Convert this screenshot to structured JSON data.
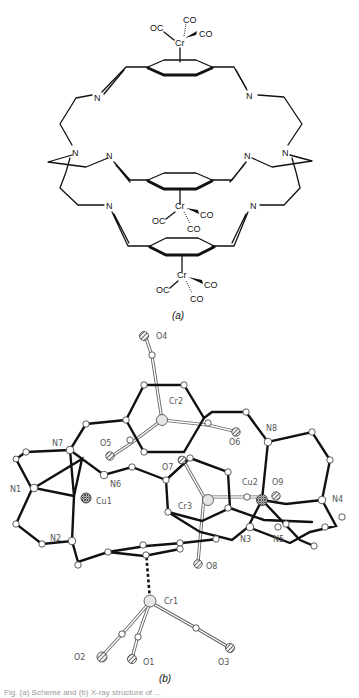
{
  "figure": {
    "panel_a": {
      "caption": "(a)",
      "cr_labels": [
        "Cr",
        "Cr",
        "Cr"
      ],
      "co_labels": [
        "OC",
        "CO",
        "CO",
        "OC",
        "CO",
        "CO",
        "OC",
        "CO",
        "CO"
      ],
      "n_labels": [
        "N",
        "N",
        "N",
        "N",
        "N",
        "N",
        "N",
        "N"
      ]
    },
    "panel_b": {
      "caption": "(b)",
      "atom_labels": {
        "O4": "O4",
        "Cr2": "Cr2",
        "O5": "O5",
        "O6": "O6",
        "N8": "N8",
        "N7": "N7",
        "O7": "O7",
        "N1": "N1",
        "N6": "N6",
        "Cu1": "Cu1",
        "Cu2": "Cu2",
        "O9": "O9",
        "N4": "N4",
        "Cr3": "Cr3",
        "N3": "N3",
        "N5": "N5",
        "N2": "N2",
        "O8": "O8",
        "Cr1": "Cr1",
        "O2": "O2",
        "O1": "O1",
        "O3": "O3"
      }
    },
    "footnote": "Fig. (a) Scheme and (b) X-ray structure of ..."
  }
}
